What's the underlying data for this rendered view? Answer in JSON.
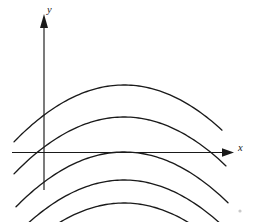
{
  "figure": {
    "background_color": "#ffffff",
    "stroke_color": "#1a1a1a",
    "width": 253,
    "height": 222
  },
  "axes": {
    "x_axis": {
      "label": "x",
      "label_x": 238,
      "label_y": 151,
      "y_pixel": 152.5,
      "x_start": 12,
      "x_end": 226,
      "arrow_tip_x": 234,
      "has_arrow": true,
      "has_ticks": false,
      "tick_labels": []
    },
    "y_axis": {
      "label": "y",
      "label_x": 47,
      "label_y": 13,
      "x_pixel": 44,
      "y_start": 190,
      "y_end": 24,
      "arrow_tip_y": 14,
      "has_arrow": true,
      "has_ticks": false,
      "tick_labels": []
    },
    "origin": {
      "x": 44,
      "y": 152.5
    }
  },
  "corner_mark": {
    "name": "page-corner-speck",
    "x": 240,
    "y": 211,
    "radius": 1.6,
    "color": "#c9c9c9"
  },
  "chart_data": {
    "type": "line",
    "title": "",
    "subtitle": "",
    "xlabel": "x",
    "ylabel": "y",
    "grid": false,
    "legend": null,
    "axis_units": "pixels",
    "curvature_a": 0.0047,
    "vertex_x": 124,
    "pixel_y_of_x_axis": 152.5,
    "series": [
      {
        "name": "curve-1-top",
        "vertex_px": [
          124,
          85
        ],
        "vertex_value": [
          0,
          67.5
        ],
        "x_left_px": 14,
        "x_right_px": 222,
        "crosses_x_axis": false
      },
      {
        "name": "curve-2",
        "vertex_px": [
          124,
          117
        ],
        "vertex_value": [
          0,
          35.5
        ],
        "x_left_px": 14,
        "x_right_px": 226,
        "crosses_x_axis": false
      },
      {
        "name": "curve-3-tangent",
        "vertex_px": [
          124,
          152
        ],
        "vertex_value": [
          0,
          0.5
        ],
        "x_left_px": 16,
        "x_right_px": 228,
        "crosses_x_axis": true
      },
      {
        "name": "curve-4",
        "vertex_px": [
          124,
          180
        ],
        "vertex_value": [
          0,
          -27.5
        ],
        "x_left_px": 22,
        "x_right_px": 228,
        "crosses_x_axis": true
      },
      {
        "name": "curve-5-bottom",
        "vertex_px": [
          124,
          203
        ],
        "vertex_value": [
          0,
          -50.5
        ],
        "x_left_px": 30,
        "x_right_px": 226,
        "crosses_x_axis": true
      }
    ]
  }
}
